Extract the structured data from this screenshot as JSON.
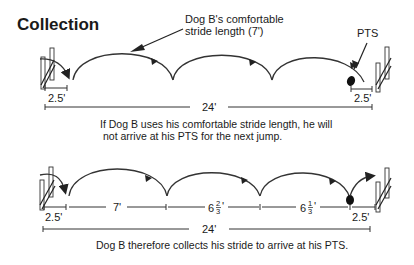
{
  "title": "Collection",
  "top": {
    "callout": {
      "line1": "Dog B's comfortable",
      "line2": "stride length (7')"
    },
    "pts_label": "PTS",
    "takeoff_left": "2.5'",
    "takeoff_right": "2.5'",
    "total": "24'",
    "caption_line1": "If Dog B uses his comfortable stride length, he will",
    "caption_line2": "not arrive at his PTS for the next jump.",
    "strides": [
      "7'",
      "7'",
      "7'"
    ]
  },
  "bottom": {
    "takeoff_left": "2.5'",
    "stride1": "7'",
    "stride2": {
      "whole": "6",
      "num": "2",
      "den": "3",
      "unit": "'"
    },
    "stride3": {
      "whole": "6",
      "num": "1",
      "den": "3",
      "unit": "'"
    },
    "takeoff_right": "2.5'",
    "total": "24'",
    "caption": "Dog B therefore collects his stride to arrive at his PTS."
  },
  "icons": {
    "jump": "jump-hurdle-icon",
    "arrow": "stride-arrow-icon",
    "pts": "pts-dot-icon"
  },
  "colors": {
    "ink": "#1a1a1a",
    "background": "#ffffff"
  }
}
